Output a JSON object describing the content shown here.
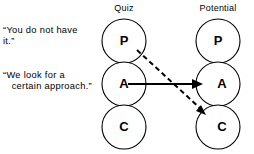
{
  "diagram": {
    "columns": [
      {
        "id": "quiz",
        "label": "Quiz",
        "cx": 124,
        "label_x": 124,
        "label_y": 11
      },
      {
        "id": "potential",
        "label": "Potential",
        "cx": 218,
        "label_x": 218,
        "label_y": 11
      }
    ],
    "nodes": [
      {
        "id": "quiz-p",
        "column": "quiz",
        "label": "P",
        "cx": 124,
        "cy": 41,
        "r": 22
      },
      {
        "id": "quiz-a",
        "column": "quiz",
        "label": "A",
        "cx": 124,
        "cy": 84,
        "r": 22
      },
      {
        "id": "quiz-c",
        "column": "quiz",
        "label": "C",
        "cx": 124,
        "cy": 127,
        "r": 22
      },
      {
        "id": "potential-p",
        "column": "potential",
        "label": "P",
        "cx": 218,
        "cy": 41,
        "r": 22
      },
      {
        "id": "potential-a",
        "column": "potential",
        "label": "A",
        "cx": 218,
        "cy": 84,
        "r": 22
      },
      {
        "id": "potential-c",
        "column": "potential",
        "label": "C",
        "cx": 218,
        "cy": 127,
        "r": 22
      }
    ],
    "edges": [
      {
        "id": "edge-a-to-a",
        "style": "solid",
        "from": "quiz-a",
        "to": "potential-a",
        "x1": 128,
        "y1": 84,
        "x2": 199,
        "y2": 84,
        "arrow": true
      },
      {
        "id": "edge-p-to-c",
        "style": "dashed",
        "from": "quiz-p",
        "to": "potential-c",
        "x1": 137,
        "y1": 50,
        "x2": 204,
        "y2": 112,
        "arrow": true
      }
    ],
    "annotations": [
      {
        "id": "annotation-you-do-not-have-it",
        "lines": [
          "“You do not have",
          "it.”"
        ],
        "x": 3,
        "y": 30
      },
      {
        "id": "annotation-we-look-for-a-certain-approach",
        "lines": [
          "“We look for a",
          "   certain approach.”"
        ],
        "x": 3,
        "y": 75
      }
    ],
    "colors": {
      "stroke": "#000000",
      "background": "#ffffff",
      "node_fill": "#ffffff"
    }
  }
}
